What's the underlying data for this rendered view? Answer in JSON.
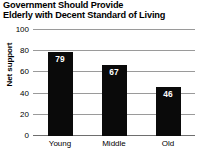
{
  "chart_data": {
    "type": "bar",
    "title": "Government Should Provide Elderly with Decent Standard of Living",
    "title_lines": [
      "Government Should Provide",
      "Elderly with Decent Standard of Living"
    ],
    "categories": [
      "Young",
      "Middle",
      "Old"
    ],
    "values": [
      79,
      67,
      46
    ],
    "xlabel": "",
    "ylabel": "Net support",
    "ylim": [
      0,
      100
    ],
    "yticks": [
      0,
      20,
      40,
      60,
      80,
      100
    ],
    "ytick_labels": [
      "0",
      "20",
      "40",
      "60",
      "80",
      "100"
    ],
    "grid": true,
    "legend": false,
    "bar_color": "#0a0a0a",
    "grid_color": "#9a9a9a",
    "value_label_color": "#ffffff",
    "background_color": "#ffffff"
  }
}
